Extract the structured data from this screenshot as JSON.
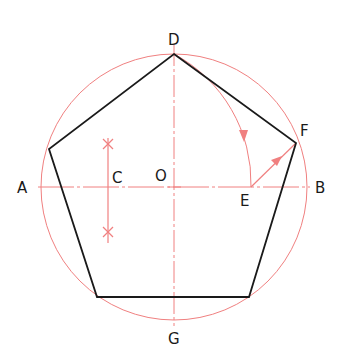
{
  "colors": {
    "construction": "#f08080",
    "pentagon": "#1a1a1a",
    "background": "#ffffff"
  },
  "circle": {
    "center": [
      174,
      187
    ],
    "radius": 133
  },
  "pentagon": {
    "vertices": [
      [
        174,
        54
      ],
      [
        296,
        143
      ],
      [
        249,
        297
      ],
      [
        97,
        297
      ],
      [
        49,
        149
      ]
    ]
  },
  "axes": {
    "horizontal": {
      "from": [
        38,
        187
      ],
      "to": [
        310,
        187
      ]
    },
    "vertical": {
      "from": [
        174,
        44
      ],
      "to": [
        174,
        326
      ]
    }
  },
  "bisector": {
    "x": 108,
    "y1": 138,
    "y2": 243,
    "marks_y": [
      144,
      232
    ]
  },
  "arc_DE": {
    "center": [
      108,
      187
    ],
    "start": [
      174,
      54
    ],
    "end": [
      251,
      187
    ]
  },
  "line_EF": {
    "from": [
      251,
      187
    ],
    "to": [
      296,
      143
    ]
  },
  "labels": {
    "A": "A",
    "B": "B",
    "C": "C",
    "D": "D",
    "E": "E",
    "F": "F",
    "G": "G",
    "O": "O"
  }
}
